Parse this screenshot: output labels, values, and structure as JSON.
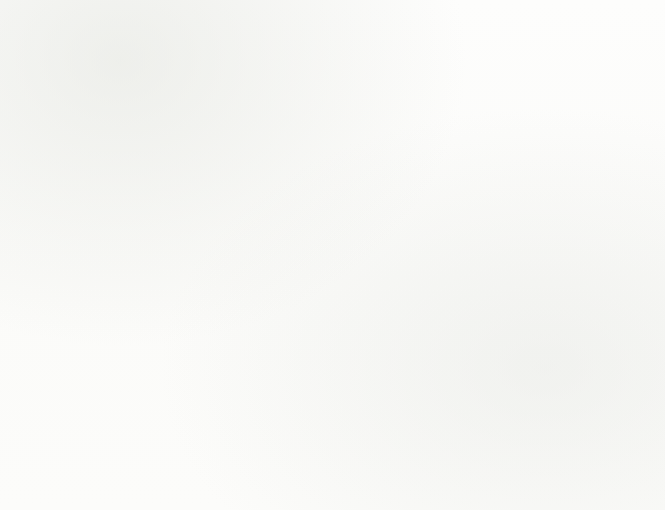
{
  "title": "Exports, Imports and Trade Balance, by year",
  "subtitle": "(Bln US$ by year)",
  "legend": {
    "items": [
      {
        "label": "Exports",
        "type": "swatch",
        "color": "#4e5b8d",
        "icon": "square-swatch-icon"
      },
      {
        "label": "Imports",
        "type": "swatch",
        "color": "#b8cade",
        "icon": "square-swatch-icon"
      },
      {
        "label": "Trade Balance",
        "type": "line-marker",
        "color": "#9e2a22",
        "icon": "line-marker-icon"
      }
    ]
  },
  "annotations": {
    "na_above": "(na)",
    "na_below": "(na)"
  },
  "colors": {
    "exports": "#4e5b8d",
    "imports": "#b8cade",
    "trade_balance": "#9e2a22",
    "axis": "#111111",
    "background": "#fdfdfb"
  },
  "chart_data": {
    "type": "bar",
    "title": "Exports, Imports and Trade Balance, by year",
    "subtitle": "(Bln US$ by year)",
    "xlabel": "",
    "ylabel": "(Bln US$ by year)",
    "ylim": [
      -50,
      50
    ],
    "ytick_step": 10,
    "yticks": [
      50,
      40,
      30,
      20,
      10,
      0,
      -10,
      -20,
      -30,
      -40,
      -50
    ],
    "ytick_labels": [
      "50",
      "40",
      "30",
      "20",
      "10",
      "0",
      "−10",
      "−20",
      "−30",
      "−40",
      "−50"
    ],
    "categories": [
      "2001",
      "2002",
      "2003",
      "2004",
      "2005",
      "2006",
      "2007",
      "2008",
      "2009",
      "2010",
      "2011",
      "2012",
      "2013"
    ],
    "xtick_labels": [
      "2001",
      "2002",
      "2003",
      "2004",
      "2005",
      "2006",
      "2007",
      "2008",
      "2009",
      "2010",
      "2011",
      "2012",
      "2013",
      "2014"
    ],
    "grid": false,
    "legend_position": "top",
    "series": [
      {
        "name": "Exports",
        "type": "bar",
        "color": "#4e5b8d",
        "values": [
          7,
          7.5,
          8.5,
          10,
          11.5,
          12.5,
          14.5,
          20,
          14,
          18,
          22,
          21.5,
          22
        ]
      },
      {
        "name": "Imports",
        "type": "bar",
        "color": "#b8cade",
        "values": [
          -10.5,
          -11.5,
          -14,
          -17.5,
          -21,
          -23,
          -31.5,
          -44.5,
          -33,
          -35.5,
          -44.5,
          -45,
          -45.5
        ]
      },
      {
        "name": "Trade Balance",
        "type": "line",
        "color": "#9e2a22",
        "values": [
          -3.5,
          -4,
          -5.5,
          -7.5,
          -9.5,
          -10.5,
          -17,
          -22,
          -18.5,
          -17,
          -22.5,
          -23,
          -23
        ]
      }
    ]
  }
}
